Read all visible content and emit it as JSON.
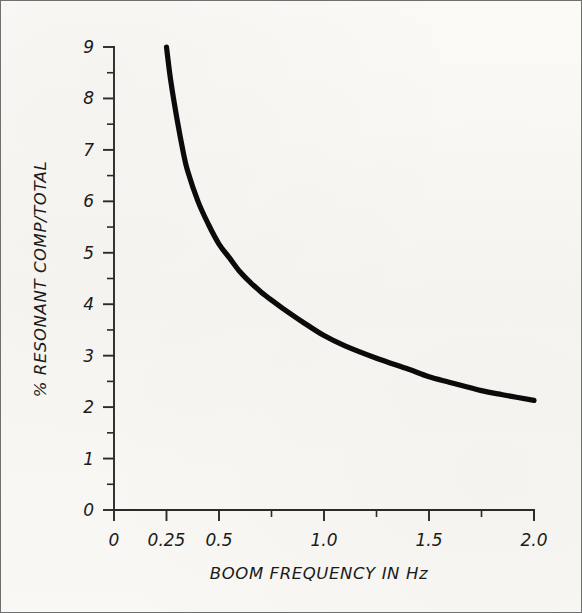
{
  "figure": {
    "background_color": "#f8f7f3",
    "border_color": "#6f6f6f",
    "ink_color": "#0b0b0b"
  },
  "chart_data": {
    "type": "line",
    "title": "",
    "subtitle": "",
    "xlabel": "BOOM FREQUENCY IN Hz",
    "ylabel": "% RESONANT COMP/TOTAL",
    "xlim": [
      0,
      2.0
    ],
    "ylim": [
      0,
      9
    ],
    "grid": false,
    "legend": null,
    "x_tick_labels": [
      "0",
      "0.25",
      "0.5",
      "1.0",
      "1.5",
      "2.0"
    ],
    "x_tick_values": [
      0,
      0.25,
      0.5,
      1.0,
      1.5,
      2.0
    ],
    "x_minor_tick_values": [
      0.75,
      1.25,
      1.75
    ],
    "y_tick_labels": [
      "0",
      "1",
      "2",
      "3",
      "4",
      "5",
      "6",
      "7",
      "8",
      "9"
    ],
    "y_tick_values": [
      0,
      1,
      2,
      3,
      4,
      5,
      6,
      7,
      8,
      9
    ],
    "y_minor_tick_values": [
      0.5,
      1.5,
      2.5,
      3.5,
      4.5,
      5.5,
      6.5,
      7.5,
      8.5
    ],
    "series": [
      {
        "name": "% resonant component of total",
        "x": [
          0.25,
          0.27,
          0.3,
          0.33,
          0.35,
          0.4,
          0.45,
          0.5,
          0.55,
          0.6,
          0.65,
          0.7,
          0.75,
          0.8,
          0.9,
          1.0,
          1.1,
          1.25,
          1.4,
          1.5,
          1.6,
          1.75,
          1.85,
          2.0
        ],
        "y": [
          9.0,
          8.35,
          7.6,
          6.95,
          6.6,
          6.0,
          5.55,
          5.17,
          4.9,
          4.63,
          4.42,
          4.24,
          4.08,
          3.93,
          3.65,
          3.39,
          3.19,
          2.95,
          2.74,
          2.59,
          2.48,
          2.32,
          2.24,
          2.13
        ]
      }
    ]
  },
  "axis_labels": {
    "x_title": "BOOM FREQUENCY IN Hz",
    "y_title": "% RESONANT COMP/TOTAL"
  }
}
